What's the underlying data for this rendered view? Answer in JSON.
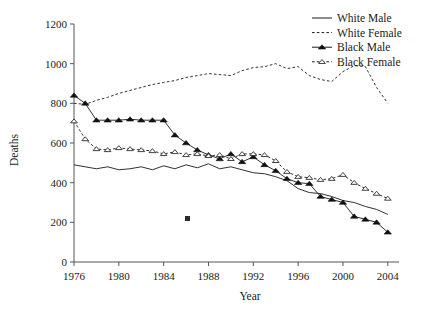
{
  "chart_data": {
    "type": "line",
    "title": "",
    "xlabel": "Year",
    "ylabel": "Deaths",
    "xlim": [
      1976,
      2005
    ],
    "ylim": [
      0,
      1200
    ],
    "xticks": [
      1976,
      1980,
      1984,
      1988,
      1992,
      1996,
      2000,
      2004
    ],
    "yticks": [
      0,
      200,
      400,
      600,
      800,
      1000,
      1200
    ],
    "grid": false,
    "legend_position": "top-right",
    "x": [
      1976,
      1977,
      1978,
      1979,
      1980,
      1981,
      1982,
      1983,
      1984,
      1985,
      1986,
      1987,
      1988,
      1989,
      1990,
      1991,
      1992,
      1993,
      1994,
      1995,
      1996,
      1997,
      1998,
      1999,
      2000,
      2001,
      2002,
      2003,
      2004
    ],
    "series": [
      {
        "name": "White Male",
        "style": "solid-line",
        "marker": "none",
        "color": "#1a1a1a",
        "values": [
          490,
          480,
          470,
          480,
          465,
          470,
          480,
          465,
          485,
          470,
          490,
          475,
          495,
          470,
          480,
          465,
          450,
          445,
          430,
          410,
          370,
          350,
          345,
          330,
          310,
          300,
          280,
          265,
          240
        ]
      },
      {
        "name": "White Female",
        "style": "dashed-line",
        "marker": "none",
        "color": "#1a1a1a",
        "values": [
          800,
          795,
          815,
          830,
          850,
          865,
          880,
          895,
          905,
          915,
          930,
          940,
          950,
          945,
          940,
          965,
          980,
          985,
          1000,
          975,
          985,
          940,
          920,
          910,
          960,
          990,
          985,
          880,
          800
        ]
      },
      {
        "name": "Black Male",
        "style": "solid-line",
        "marker": "filled-triangle",
        "color": "#1a1a1a",
        "values": [
          840,
          800,
          715,
          715,
          715,
          720,
          715,
          715,
          715,
          640,
          600,
          565,
          540,
          520,
          545,
          505,
          530,
          490,
          460,
          420,
          400,
          395,
          330,
          315,
          300,
          230,
          215,
          200,
          150
        ]
      },
      {
        "name": "Black Female",
        "style": "dashed-line",
        "marker": "open-triangle",
        "color": "#1a1a1a",
        "values": [
          710,
          620,
          570,
          565,
          575,
          570,
          565,
          560,
          545,
          555,
          540,
          545,
          535,
          540,
          520,
          545,
          545,
          540,
          510,
          455,
          430,
          425,
          415,
          420,
          440,
          400,
          370,
          345,
          320
        ]
      }
    ]
  },
  "legend": {
    "items": [
      {
        "label": "White Male"
      },
      {
        "label": "White Female"
      },
      {
        "label": "Black Male"
      },
      {
        "label": "Black Female"
      }
    ]
  },
  "axes": {
    "y_title": "Deaths",
    "x_title": "Year",
    "y_tick_labels": [
      "1200",
      "1000",
      "800",
      "600",
      "400",
      "200",
      "0"
    ],
    "x_tick_labels": [
      "1976",
      "1980",
      "1984",
      "1988",
      "1992",
      "1996",
      "2000",
      "2004"
    ]
  }
}
